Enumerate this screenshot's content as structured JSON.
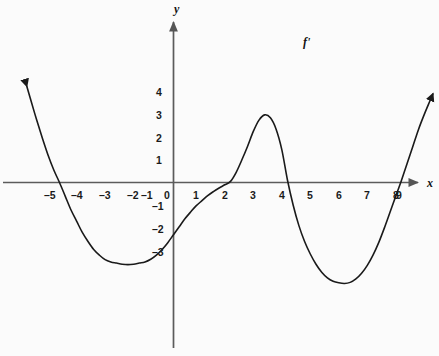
{
  "figure": {
    "title": "",
    "background_color": "#fbfbfb",
    "width": 439,
    "height": 356
  },
  "axes": {
    "x_axis_label": "x",
    "y_axis_label": "y",
    "axis_color": "#555555",
    "origin_label": "0"
  },
  "curve": {
    "label": "f'",
    "color": "#1a1a1a",
    "stroke_width": 1.6,
    "left_arrow": true,
    "right_arrow": true
  },
  "chart_data": {
    "type": "line",
    "title": "",
    "subtitle": "",
    "xlabel": "x",
    "ylabel": "y",
    "legend": [
      "f'"
    ],
    "legend_position": "top-right",
    "grid": false,
    "xlim": [
      -5.6,
      9.8
    ],
    "ylim": [
      -4.9,
      4.9
    ],
    "xticks": [
      -5,
      -4,
      -3,
      -2,
      -1,
      0,
      1,
      2,
      3,
      4,
      5,
      6,
      7,
      8,
      9
    ],
    "xtick_labels": [
      "–5",
      "–4",
      "–3",
      "–2",
      "–1",
      "0",
      "1",
      "2",
      "3",
      "4",
      "5",
      "6",
      "7",
      "8",
      "9"
    ],
    "yticks": [
      -3,
      -2,
      -1,
      0,
      1,
      2,
      3,
      4
    ],
    "ytick_labels": [
      "–3",
      "–2",
      "–1",
      "0",
      "1",
      "2",
      "3",
      "4"
    ],
    "series": [
      {
        "name": "f'",
        "x": [
          -5.15,
          -5.0,
          -4.8,
          -4.6,
          -4.4,
          -4.2,
          -4.0,
          -3.8,
          -3.6,
          -3.4,
          -3.2,
          -3.0,
          -2.8,
          -2.6,
          -2.4,
          -2.2,
          -2.0,
          -1.8,
          -1.6,
          -1.4,
          -1.2,
          -1.0,
          -0.8,
          -0.6,
          -0.4,
          -0.2,
          0.0,
          0.2,
          0.4,
          0.6,
          0.8,
          1.0,
          1.2,
          1.4,
          1.6,
          1.8,
          2.0,
          2.2,
          2.4,
          2.6,
          2.8,
          3.0,
          3.2,
          3.4,
          3.6,
          3.8,
          4.0,
          4.2,
          4.4,
          4.6,
          4.8,
          5.0,
          5.2,
          5.4,
          5.6,
          5.8,
          6.0,
          6.2,
          6.4,
          6.6,
          6.8,
          7.0,
          7.2,
          7.4,
          7.6,
          7.8,
          8.0,
          8.2,
          8.4,
          8.6,
          8.8,
          9.0,
          9.1
        ],
        "y": [
          4.25,
          3.6,
          2.75,
          1.95,
          1.2,
          0.55,
          0.0,
          -0.6,
          -1.2,
          -1.7,
          -2.2,
          -2.6,
          -2.95,
          -3.2,
          -3.4,
          -3.5,
          -3.55,
          -3.6,
          -3.62,
          -3.6,
          -3.55,
          -3.5,
          -3.38,
          -3.2,
          -2.95,
          -2.65,
          -2.3,
          -1.95,
          -1.6,
          -1.3,
          -1.02,
          -0.8,
          -0.58,
          -0.4,
          -0.24,
          -0.1,
          0.05,
          0.45,
          1.0,
          1.6,
          2.25,
          2.75,
          2.98,
          2.85,
          2.35,
          1.45,
          0.1,
          -1.0,
          -1.9,
          -2.6,
          -3.15,
          -3.6,
          -3.95,
          -4.2,
          -4.35,
          -4.42,
          -4.45,
          -4.4,
          -4.25,
          -4.0,
          -3.65,
          -3.2,
          -2.65,
          -2.0,
          -1.3,
          -0.6,
          0.1,
          0.85,
          1.6,
          2.35,
          3.0,
          3.6,
          3.9
        ],
        "roots": [
          -4.0,
          2.0,
          4.05,
          8.0
        ],
        "local_minima": [
          {
            "x": -1.6,
            "y": -3.62
          },
          {
            "x": 6.0,
            "y": -4.45
          }
        ],
        "local_maxima": [
          {
            "x": 3.2,
            "y": 2.98
          }
        ]
      }
    ],
    "annotations": [
      {
        "text": "f'",
        "x": 7.3,
        "y": 4.1
      }
    ]
  },
  "xtick_positions_px": [
    {
      "label": "–5",
      "left": 44,
      "top": 190
    },
    {
      "label": "–4",
      "left": 70,
      "top": 190
    },
    {
      "label": "–3",
      "left": 97,
      "top": 190
    },
    {
      "label": "–2",
      "left": 125,
      "top": 190
    },
    {
      "label": "–1",
      "left": 139,
      "top": 190
    },
    {
      "label": "0",
      "left": 164,
      "top": 190
    },
    {
      "label": "1",
      "left": 193,
      "top": 190
    },
    {
      "label": "2",
      "left": 221,
      "top": 190
    },
    {
      "label": "3",
      "left": 250,
      "top": 190
    },
    {
      "label": "4",
      "left": 278,
      "top": 190
    },
    {
      "label": "5",
      "left": 307,
      "top": 190
    },
    {
      "label": "6",
      "left": 335,
      "top": 190
    },
    {
      "label": "7",
      "left": 364,
      "top": 190
    },
    {
      "label": "8",
      "left": 392,
      "top": 190
    },
    {
      "label": "9",
      "left": 395,
      "top": 190
    }
  ]
}
